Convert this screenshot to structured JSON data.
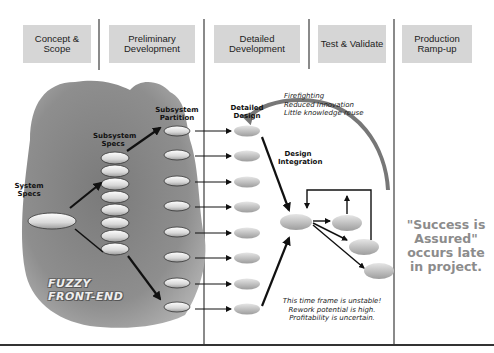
{
  "phases": [
    {
      "label": "Concept & Scope"
    },
    {
      "label": "Preliminary Development"
    },
    {
      "label": "Detailed Development"
    },
    {
      "label": "Test & Validate"
    },
    {
      "label": "Production Ramp-up"
    }
  ],
  "diagram": {
    "system_specs": "System Specs",
    "subsystem_specs": "Subsystem Specs",
    "subsystem_partition": "Subsystem Partition",
    "detailed_design": "Detailed Design",
    "design_integration": "Design Integration",
    "fuzzy_front_end": "FUZZY FRONT-END",
    "feedback_notes": [
      "Firefighting",
      "Reduced Innovation",
      "Little knowledge reuse"
    ],
    "instability_notes": [
      "This time frame is unstable!",
      "Rework potential is high.",
      "Profitability is uncertain."
    ],
    "success_note": "\"Success is Assured\" occurs late in project.",
    "subsystem_specs_count": 8,
    "subsystem_partition_count": 8,
    "detailed_design_count": 8,
    "test_nodes_count": 3
  },
  "colors": {
    "header_box": "#d6d6d6",
    "separator": "#8a8a8a",
    "blob": "#8f8f8f",
    "success_text": "#8c8c8c"
  }
}
